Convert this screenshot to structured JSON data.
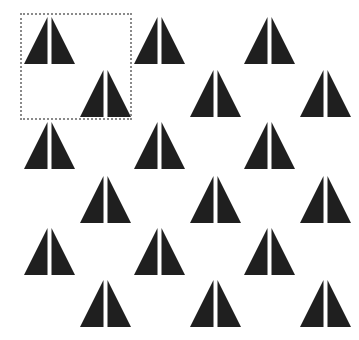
{
  "canvas": {
    "width": 359,
    "height": 340,
    "background": "#ffffff"
  },
  "shape": {
    "name": "split-triangle",
    "fill": "#1f1f1f",
    "width": 51,
    "height": 47,
    "gap": 4
  },
  "selection": {
    "left": 20,
    "top": 13,
    "width": 112,
    "height": 107,
    "border_color": "#8a8a8a",
    "style": "dotted"
  },
  "figures": [
    {
      "row": 1,
      "col": 1,
      "x": 24,
      "y": 17
    },
    {
      "row": 1,
      "col": 2,
      "x": 134,
      "y": 17
    },
    {
      "row": 1,
      "col": 3,
      "x": 244,
      "y": 17
    },
    {
      "row": 2,
      "col": 1,
      "x": 80,
      "y": 70
    },
    {
      "row": 2,
      "col": 2,
      "x": 190,
      "y": 70
    },
    {
      "row": 2,
      "col": 3,
      "x": 300,
      "y": 70
    },
    {
      "row": 3,
      "col": 1,
      "x": 24,
      "y": 122
    },
    {
      "row": 3,
      "col": 2,
      "x": 134,
      "y": 122
    },
    {
      "row": 3,
      "col": 3,
      "x": 244,
      "y": 122
    },
    {
      "row": 4,
      "col": 1,
      "x": 80,
      "y": 176
    },
    {
      "row": 4,
      "col": 2,
      "x": 190,
      "y": 176
    },
    {
      "row": 4,
      "col": 3,
      "x": 300,
      "y": 176
    },
    {
      "row": 5,
      "col": 1,
      "x": 24,
      "y": 228
    },
    {
      "row": 5,
      "col": 2,
      "x": 134,
      "y": 228
    },
    {
      "row": 5,
      "col": 3,
      "x": 244,
      "y": 228
    },
    {
      "row": 6,
      "col": 1,
      "x": 80,
      "y": 280
    },
    {
      "row": 6,
      "col": 2,
      "x": 190,
      "y": 280
    },
    {
      "row": 6,
      "col": 3,
      "x": 300,
      "y": 280
    }
  ]
}
